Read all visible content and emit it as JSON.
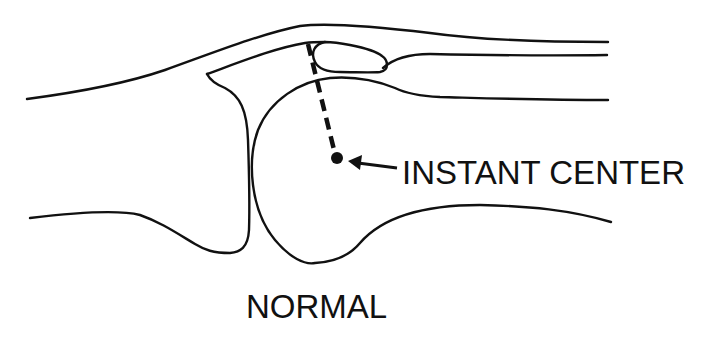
{
  "diagram": {
    "labels": {
      "instant_center": "INSTANT CENTER",
      "caption": "NORMAL"
    },
    "colors": {
      "line": "#111111",
      "background": "#ffffff"
    },
    "elements": [
      "proximal bone outline",
      "distal bone head (condyle)",
      "tendon/ligament band",
      "dashed radius line",
      "instant center point",
      "pointer arrow"
    ]
  }
}
